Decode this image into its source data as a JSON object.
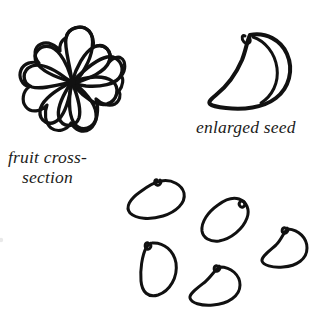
{
  "illustration": {
    "kind": "botanical-line-drawing",
    "medium": "hand-drawn ink on paper",
    "background_color": "#ffffff",
    "ink_color": "#111111"
  },
  "captions": {
    "fruit_cross_section": {
      "line_1": "fruit cross-",
      "line_2": "section"
    },
    "enlarged_seed": "enlarged seed"
  },
  "figures": {
    "fruit_cross_section": {
      "label": "fruit cross-section",
      "description": "rosette of radiating fruit segments around a central point",
      "segment_count": 9,
      "center": {
        "x": 72,
        "y": 82
      },
      "radius": 55
    },
    "enlarged_seed": {
      "label": "enlarged seed",
      "description": "crescent kidney-shaped seed with hilum notch and inner ridge line",
      "hilum_notch": "top-left",
      "has_inner_ridge": true
    },
    "seed_cluster": {
      "description": "scattered group of small seeds",
      "count": 5,
      "seeds": [
        {
          "name": "seed-1",
          "orientation": "horizontal tilted",
          "notch_position": "top"
        },
        {
          "name": "seed-2",
          "orientation": "crescent opening lower-left",
          "notch_position": "right"
        },
        {
          "name": "seed-3",
          "orientation": "vertical D-shape",
          "notch_position": "upper-left"
        },
        {
          "name": "seed-4",
          "orientation": "pointed tail left",
          "notch_position": "top"
        },
        {
          "name": "seed-5",
          "orientation": "pointed tail left",
          "notch_position": "top-left"
        }
      ]
    }
  },
  "artifacts": {
    "left_edge_speck": "faint scan speck at left margin"
  }
}
